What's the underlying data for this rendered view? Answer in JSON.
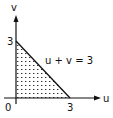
{
  "diagram": {
    "axes": {
      "vertical_label": "v",
      "horizontal_label": "u",
      "origin_label": "0"
    },
    "ticks": {
      "v_intercept": "3",
      "u_intercept": "3"
    },
    "line_label": "u + v = 3",
    "region": {
      "description": "shaded triangle bounded by u-axis, v-axis and line u + v = 3",
      "vertices": [
        [
          0,
          0
        ],
        [
          3,
          0
        ],
        [
          0,
          3
        ]
      ]
    },
    "colors": {
      "ink": "#111111",
      "background": "#ffffff"
    }
  }
}
